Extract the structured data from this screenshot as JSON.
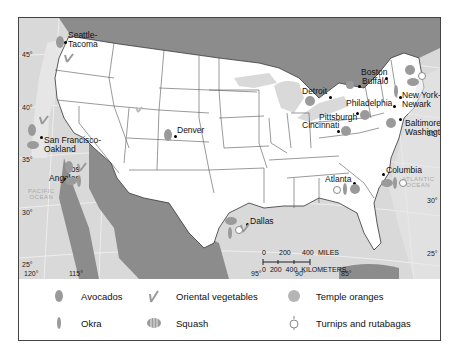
{
  "map": {
    "cities": [
      {
        "name": "Seattle-\nTacoma",
        "l1": "Seattle-",
        "l2": "Tacoma"
      },
      {
        "name": "San Francisco-Oakland",
        "l1": "San Francisco-",
        "l2": "Oakland"
      },
      {
        "name": "Los Angeles",
        "l1": "Los",
        "l2": "Angeles"
      },
      {
        "name": "Denver",
        "l1": "Denver"
      },
      {
        "name": "Dallas",
        "l1": "Dallas"
      },
      {
        "name": "Detroit",
        "l1": "Detroit"
      },
      {
        "name": "Buffalo",
        "l1": "Buffalo"
      },
      {
        "name": "Boston",
        "l1": "Boston"
      },
      {
        "name": "New York-Newark",
        "l1": "New York-",
        "l2": "Newark"
      },
      {
        "name": "Philadelphia",
        "l1": "Philadelphia"
      },
      {
        "name": "Pittsburgh",
        "l1": "Pittsburgh"
      },
      {
        "name": "Cincinnati",
        "l1": "Cincinnati"
      },
      {
        "name": "Baltimore-Washington",
        "l1": "Baltimore-",
        "l2": "Washington"
      },
      {
        "name": "Atlanta",
        "l1": "Atlanta"
      },
      {
        "name": "Columbia",
        "l1": "Columbia"
      }
    ],
    "latitudes_left": [
      "45°",
      "40°",
      "35°",
      "30°",
      "25°"
    ],
    "latitudes_right": [
      "35°",
      "30°",
      "25°"
    ],
    "longitudes": [
      "120°",
      "115°",
      "95°",
      "90°",
      "85°"
    ],
    "oceans": {
      "pacific": [
        "PACIFIC",
        "OCEAN"
      ],
      "atlantic": [
        "ATLANTIC",
        "OCEAN"
      ]
    },
    "scale": {
      "miles_ticks": [
        "0",
        "200",
        "400"
      ],
      "miles_unit": "MILES",
      "km_ticks": [
        "0",
        "200",
        "400"
      ],
      "km_unit": "KILOMETERS"
    }
  },
  "legend": {
    "items": [
      {
        "icon": "avocado-icon",
        "label": "Avocados"
      },
      {
        "icon": "okra-icon",
        "label": "Okra"
      },
      {
        "icon": "oriental-vegetables-icon",
        "label": "Oriental vegetables"
      },
      {
        "icon": "squash-icon",
        "label": "Squash"
      },
      {
        "icon": "temple-orange-icon",
        "label": "Temple oranges"
      },
      {
        "icon": "turnip-icon",
        "label": "Turnips and rutabagas"
      }
    ]
  },
  "colors": {
    "land_us": "#ffffff",
    "land_foreign": "#8c8c8c",
    "water": "#d9d9d9",
    "coastal_band": "#e6e6e6",
    "icon": "#9a9a9a",
    "border": "#444444"
  }
}
